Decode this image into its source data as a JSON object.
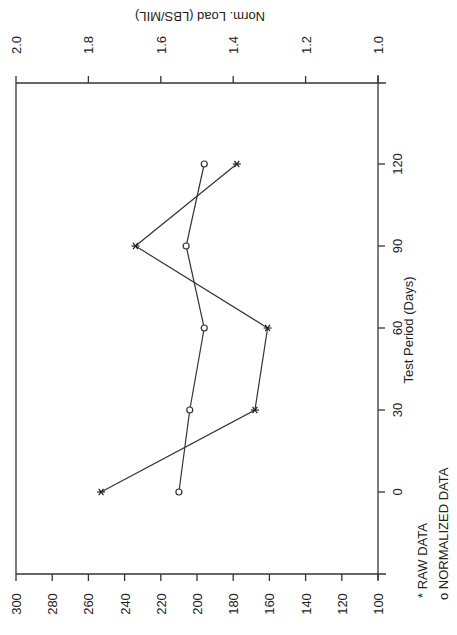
{
  "chart_data": {
    "type": "line",
    "orientation": "rotated-90-ccw",
    "title": "",
    "xlabel": "Test Period (Days)",
    "ylabel_left": "",
    "ylabel_right": "Norm. Load (LBS/MIL)",
    "x": [
      0,
      30,
      60,
      90,
      120
    ],
    "x_ticks": [
      0,
      30,
      60,
      90,
      120
    ],
    "x_tick_labels": [
      "0",
      "30",
      "60",
      "90",
      "120"
    ],
    "y_primary": {
      "label": "",
      "range": [
        100,
        300
      ],
      "ticks": [
        300,
        280,
        260,
        240,
        220,
        200,
        180,
        160,
        140,
        120,
        100
      ],
      "tick_labels": [
        "300",
        "280",
        "260",
        "240",
        "220",
        "200",
        "180",
        "160",
        "140",
        "120",
        "100"
      ]
    },
    "y_secondary": {
      "label": "Norm. Load (LBS/MIL)",
      "range": [
        1.0,
        2.0
      ],
      "ticks": [
        2.0,
        1.8,
        1.6,
        1.4,
        1.2,
        1.0
      ],
      "tick_labels": [
        "2.0",
        "1.8",
        "1.6",
        "1.4",
        "1.2",
        "1.0"
      ]
    },
    "series": [
      {
        "name": "RAW DATA",
        "marker": "*",
        "axis": "primary",
        "values": [
          253,
          168,
          161,
          234,
          178
        ]
      },
      {
        "name": "NORMALIZED DATA",
        "marker": "o",
        "axis": "secondary",
        "values": [
          1.55,
          1.52,
          1.48,
          1.53,
          1.48
        ]
      }
    ],
    "legend": [
      {
        "symbol": "*",
        "label": "RAW DATA"
      },
      {
        "symbol": "o",
        "label": "NORMALIZED DATA"
      }
    ],
    "grid": false,
    "legend_position": "bottom-right"
  },
  "legend": {
    "raw_label": "* RAW DATA",
    "normalized_label": "o NORMALIZED DATA"
  },
  "axes": {
    "top_title": "Norm. Load (LBS/MIL)",
    "right_title": "Test Period (Days)"
  }
}
